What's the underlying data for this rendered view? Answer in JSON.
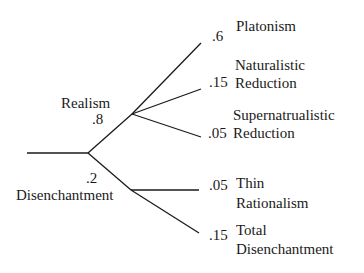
{
  "diagram": {
    "type": "probability-tree",
    "root": {
      "children": [
        {
          "label": "Realism",
          "probability": ".8",
          "children": [
            {
              "label_line1": "Platonism",
              "label_line2": "",
              "probability": ".6"
            },
            {
              "label_line1": "Naturalistic",
              "label_line2": "Reduction",
              "probability": ".15"
            },
            {
              "label_line1": "Supernatrualistic",
              "label_line2": "Reduction",
              "probability": ".05"
            }
          ]
        },
        {
          "label": "Disenchantment",
          "probability": ".2",
          "children": [
            {
              "label_line1": "Thin",
              "label_line2": "Rationalism",
              "probability": ".05"
            },
            {
              "label_line1": "Total",
              "label_line2": "Disenchantment",
              "probability": ".15"
            }
          ]
        }
      ]
    },
    "line_color": "#1a1a1a"
  }
}
